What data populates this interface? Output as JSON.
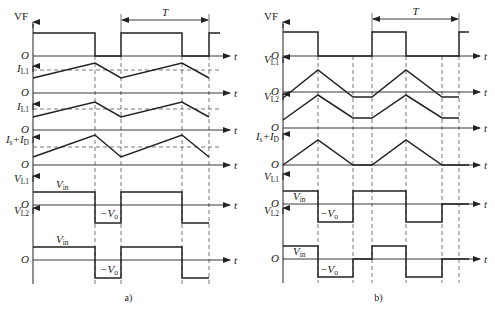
{
  "figure": {
    "style": {
      "line_color": "#222222",
      "dash_color": "#555555",
      "background": "#ffffff"
    },
    "panels": [
      {
        "id": "a",
        "caption": "a)",
        "period_label": "T",
        "axis_x": 33,
        "axis_end": 230,
        "period_arrow": {
          "x1": 121,
          "x2": 209,
          "y": 20
        },
        "dashed_verticals": [
          95,
          121,
          182,
          209
        ],
        "rows": [
          {
            "label": "VF",
            "label_sub": "",
            "origin": "O",
            "t_label": "t",
            "axis_y": 56,
            "label_y": 20,
            "points": [
              [
                33,
                33
              ],
              [
                95,
                33
              ],
              [
                95,
                56
              ],
              [
                121,
                56
              ],
              [
                121,
                33
              ],
              [
                182,
                33
              ],
              [
                182,
                56
              ],
              [
                209,
                56
              ],
              [
                209,
                33
              ],
              [
                220,
                33
              ]
            ]
          },
          {
            "label": "I",
            "label_sub": "L1",
            "origin": "O",
            "t_label": "t",
            "axis_y": 93,
            "label_y": 72,
            "avg_y": 70,
            "points": [
              [
                33,
                78
              ],
              [
                95,
                63
              ],
              [
                121,
                78
              ],
              [
                182,
                63
              ],
              [
                209,
                78
              ]
            ]
          },
          {
            "label": "I",
            "label_sub": "L1",
            "origin": "O",
            "t_label": "t",
            "axis_y": 130,
            "label_y": 110,
            "avg_y": 109,
            "points": [
              [
                33,
                117
              ],
              [
                95,
                102
              ],
              [
                121,
                117
              ],
              [
                182,
                102
              ],
              [
                209,
                117
              ]
            ]
          },
          {
            "label": "I",
            "label_sub": "s",
            "label2": "+I",
            "label2_sub": "D",
            "origin": "O",
            "t_label": "t",
            "axis_y": 165,
            "label_y": 143,
            "avg_y": 147,
            "points": [
              [
                33,
                157
              ],
              [
                95,
                135
              ],
              [
                121,
                157
              ],
              [
                182,
                135
              ],
              [
                209,
                157
              ]
            ]
          },
          {
            "label": "V",
            "label_sub": "L1",
            "origin": "O",
            "t_label": "t",
            "axis_y": 205,
            "label_y": 182,
            "level_high": "V",
            "level_high_sub": "in",
            "level_low": "−V",
            "level_low_sub": "o",
            "high_label_pos": [
              56,
              188
            ],
            "low_label_pos": [
              100,
              217
            ],
            "points": [
              [
                33,
                192
              ],
              [
                95,
                192
              ],
              [
                95,
                223
              ],
              [
                121,
                223
              ],
              [
                121,
                192
              ],
              [
                182,
                192
              ],
              [
                182,
                223
              ],
              [
                209,
                223
              ]
            ]
          },
          {
            "label": "V",
            "label_sub": "L2",
            "origin": "O",
            "t_label": "t",
            "axis_y": 260,
            "label_y": 214,
            "level_high": "V",
            "level_high_sub": "in",
            "level_low": "−V",
            "level_low_sub": "o",
            "high_label_pos": [
              56,
              243
            ],
            "low_label_pos": [
              100,
              273
            ],
            "points": [
              [
                33,
                247
              ],
              [
                95,
                247
              ],
              [
                95,
                278
              ],
              [
                121,
                278
              ],
              [
                121,
                247
              ],
              [
                182,
                247
              ],
              [
                182,
                278
              ],
              [
                209,
                278
              ]
            ]
          }
        ]
      },
      {
        "id": "b",
        "caption": "b)",
        "period_label": "T",
        "axis_x": 283,
        "axis_end": 480,
        "period_arrow": {
          "x1": 372,
          "x2": 459,
          "y": 19
        },
        "dashed_verticals": [
          318,
          353,
          372,
          406,
          442,
          459
        ],
        "rows": [
          {
            "label": "VF",
            "label_sub": "",
            "origin": "O",
            "t_label": "t",
            "axis_y": 56,
            "label_y": 20,
            "points": [
              [
                283,
                32
              ],
              [
                318,
                32
              ],
              [
                318,
                56
              ],
              [
                372,
                56
              ],
              [
                372,
                32
              ],
              [
                406,
                32
              ],
              [
                406,
                56
              ],
              [
                459,
                56
              ],
              [
                459,
                32
              ],
              [
                469,
                32
              ]
            ]
          },
          {
            "label": "V",
            "label_sub": "L1",
            "origin": "O",
            "t_label": "t",
            "axis_y": 92,
            "label_y": 63,
            "points": [
              [
                283,
                98
              ],
              [
                318,
                70
              ],
              [
                353,
                97
              ],
              [
                372,
                97
              ],
              [
                406,
                70
              ],
              [
                442,
                97
              ],
              [
                459,
                97
              ]
            ]
          },
          {
            "label": "V",
            "label_sub": "L2",
            "origin": "O",
            "t_label": "t",
            "axis_y": 128,
            "label_y": 100,
            "points": [
              [
                283,
                120
              ],
              [
                318,
                95
              ],
              [
                353,
                118
              ],
              [
                372,
                118
              ],
              [
                406,
                95
              ],
              [
                442,
                118
              ],
              [
                459,
                118
              ]
            ]
          },
          {
            "label": "I",
            "label_sub": "s",
            "label2": "+I",
            "label2_sub": "D",
            "origin": "O",
            "t_label": "t",
            "axis_y": 165,
            "label_y": 140,
            "points": [
              [
                283,
                165
              ],
              [
                318,
                140
              ],
              [
                353,
                165
              ],
              [
                372,
                165
              ],
              [
                406,
                140
              ],
              [
                442,
                165
              ],
              [
                469,
                165
              ]
            ]
          },
          {
            "label": "V",
            "label_sub": "L1",
            "origin": "O",
            "t_label": "t",
            "axis_y": 204,
            "label_y": 180,
            "level_high": "V",
            "level_high_sub": "in",
            "level_low": "−V",
            "level_low_sub": "o",
            "high_label_pos": [
              293,
              200
            ],
            "low_label_pos": [
              320,
              217
            ],
            "points": [
              [
                283,
                191
              ],
              [
                318,
                191
              ],
              [
                318,
                222
              ],
              [
                353,
                222
              ],
              [
                353,
                191
              ],
              [
                406,
                191
              ],
              [
                406,
                222
              ],
              [
                442,
                222
              ],
              [
                442,
                204
              ],
              [
                469,
                204
              ]
            ]
          },
          {
            "label": "V",
            "label_sub": "L2",
            "origin": "O",
            "t_label": "t",
            "axis_y": 259,
            "label_y": 214,
            "level_high": "V",
            "level_high_sub": "in",
            "level_low": "−V",
            "level_low_sub": "o",
            "high_label_pos": [
              293,
              255
            ],
            "low_label_pos": [
              320,
              273
            ],
            "points": [
              [
                283,
                246
              ],
              [
                318,
                246
              ],
              [
                318,
                277
              ],
              [
                353,
                277
              ],
              [
                353,
                259
              ],
              [
                372,
                259
              ],
              [
                372,
                246
              ],
              [
                406,
                246
              ],
              [
                406,
                277
              ],
              [
                442,
                277
              ],
              [
                442,
                259
              ],
              [
                469,
                259
              ]
            ]
          }
        ]
      }
    ]
  }
}
